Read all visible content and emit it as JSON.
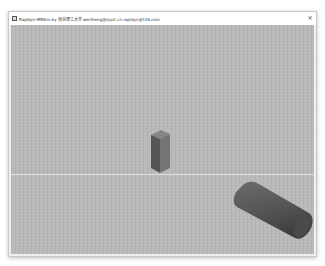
{
  "window": {
    "title": "Rapidyn-MBSim by 南京理工大学 weizheng@njust.cn rapidyn@126.com",
    "close_label": "✕",
    "icon": "app-icon"
  },
  "scene": {
    "background_color": "#b9b9b9",
    "objects": [
      {
        "name": "box",
        "color": "#6e6e6e"
      },
      {
        "name": "cylinder",
        "color": "#5a5a5a"
      }
    ]
  }
}
